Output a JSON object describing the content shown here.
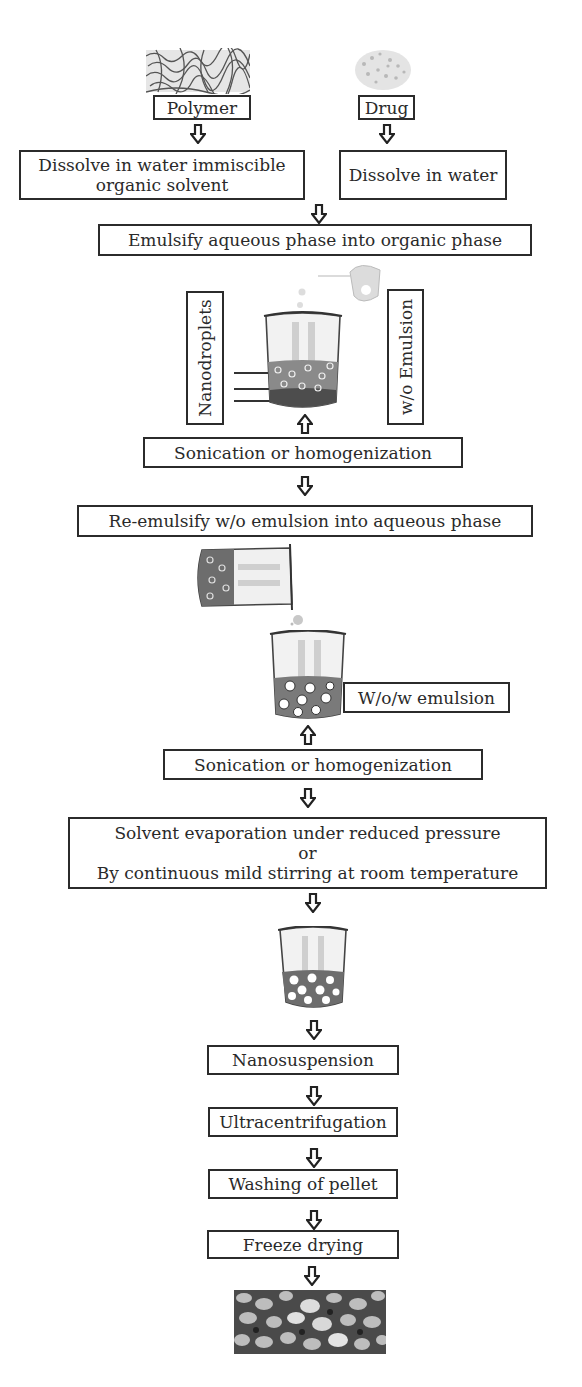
{
  "inputs": {
    "polymer": {
      "label": "Polymer",
      "image": "polymer-fibers-image"
    },
    "drug": {
      "label": "Drug",
      "image": "drug-powder-image"
    }
  },
  "steps": {
    "dissolve_polymer": [
      "Dissolve in water immiscible",
      "organic solvent"
    ],
    "dissolve_drug": "Dissolve in water",
    "emulsify": "Emulsify aqueous phase into organic phase",
    "sonication_1": "Sonication or homogenization",
    "re_emulsify": "Re-emulsify w/o emulsion into aqueous phase",
    "sonication_2": "Sonication or homogenization",
    "solvent_removal": [
      "Solvent evaporation under reduced pressure",
      "or",
      "By continuous mild stirring at room temperature"
    ],
    "nanosuspension": "Nanosuspension",
    "ultracentrifugation": "Ultracentrifugation",
    "washing": "Washing of pellet",
    "freeze_drying": "Freeze drying"
  },
  "labels": {
    "nanodroplets": "Nanodroplets",
    "wo_emulsion": "w/o Emulsion",
    "wow_emulsion": "W/o/w emulsion"
  },
  "images": {
    "beaker_1": "beaker-wo-emulsion-image",
    "tilted_beaker": "pouring-beaker-image",
    "beaker_2": "beaker-wow-emulsion-image",
    "beaker_3": "beaker-nanoparticles-image",
    "final": "nanoparticle-powder-sem-image"
  },
  "colors": {
    "stroke": "#2b2b2b",
    "liquid": "#6a6a6a",
    "background": "#ffffff"
  }
}
